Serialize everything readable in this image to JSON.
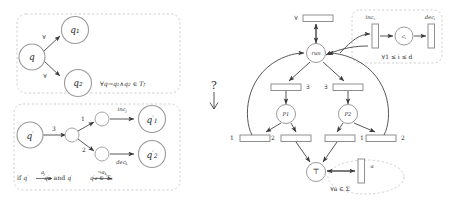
{
  "figure": {
    "left_panel": {
      "box_universal": {
        "name": "universal-branching-rule",
        "nodes": [
          {
            "id": "q",
            "label": "q"
          },
          {
            "id": "q1",
            "label": "q₁"
          },
          {
            "id": "q2",
            "label": "q₂"
          }
        ],
        "edge_labels": [
          "∀",
          "∀"
        ],
        "caption": "∀q→q₁∧q₂ ∈ T_f"
      },
      "box_existential": {
        "name": "existential-action-rule",
        "nodes": [
          {
            "id": "qp",
            "label": "q′"
          },
          {
            "id": "qp1",
            "label": "q′₁"
          },
          {
            "id": "qp2",
            "label": "q′₂"
          }
        ],
        "edge_labels": [
          "3",
          "1",
          "2"
        ],
        "transition_labels": [
          "inc_j",
          "dec_k"
        ],
        "caption": "if q′ —a_j→ q′₁ and q′ —¬a_k→ q′₂ ∈ T_a"
      }
    },
    "connector": {
      "question_mark": "?",
      "arrow": "rotated-left-arrow"
    },
    "right_panel": {
      "name": "petri-net",
      "places": [
        {
          "id": "run",
          "label": "run"
        },
        {
          "id": "ci",
          "label": "c_i"
        },
        {
          "id": "p1",
          "label": "P1"
        },
        {
          "id": "p2",
          "label": "P2"
        },
        {
          "id": "top",
          "label": "⊤"
        }
      ],
      "transitions": [
        {
          "id": "t-forall",
          "label": "∀"
        },
        {
          "id": "t-inc",
          "label": "inc_i"
        },
        {
          "id": "t-dec",
          "label": "dec_i"
        },
        {
          "id": "t-exists-left",
          "label": "∃"
        },
        {
          "id": "t-exists-right",
          "label": "∃"
        },
        {
          "id": "t-p1-1",
          "label": "1"
        },
        {
          "id": "t-p1-2",
          "label": "2"
        },
        {
          "id": "t-p2-1",
          "label": "1"
        },
        {
          "id": "t-p2-2",
          "label": "2"
        },
        {
          "id": "t-a",
          "label": "a"
        }
      ],
      "annotations": [
        {
          "id": "counter-group",
          "text": "∀1 ≤ i ≤ d"
        },
        {
          "id": "alphabet-group",
          "text": "∀a ∈ Σ"
        }
      ]
    }
  },
  "colors": {
    "stroke": "#444444",
    "node_stroke": "#9a9a9a",
    "dashed_box": "#c9c9c9",
    "text": "#2b2b2b",
    "background": "#ffffff"
  }
}
